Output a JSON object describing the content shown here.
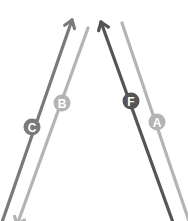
{
  "diagram": {
    "type": "lane-direction-diagram",
    "background": "#ffffff",
    "lanes": [
      {
        "id": "C",
        "label": "C",
        "color": "#7a7a7a",
        "direction": "up-right",
        "arrowhead": "top",
        "line": {
          "x1": 0,
          "y1": 228,
          "x2": 72,
          "y2": 20
        },
        "badge": {
          "cx": 32,
          "cy": 127
        }
      },
      {
        "id": "B",
        "label": "B",
        "color": "#b4b4b4",
        "direction": "up-right",
        "arrowhead": "bottom",
        "line": {
          "x1": 17,
          "y1": 225,
          "x2": 88,
          "y2": 28
        },
        "badge": {
          "cx": 62,
          "cy": 103
        }
      },
      {
        "id": "F",
        "label": "F",
        "color": "#555555",
        "direction": "up-left",
        "arrowhead": "top",
        "line": {
          "x1": 175,
          "y1": 228,
          "x2": 101,
          "y2": 22
        },
        "badge": {
          "cx": 131,
          "cy": 101
        }
      },
      {
        "id": "A",
        "label": "A",
        "color": "#b4b4b4",
        "direction": "up-left",
        "arrowhead": "bottom",
        "line": {
          "x1": 192,
          "y1": 230,
          "x2": 122,
          "y2": 23
        },
        "badge": {
          "cx": 157,
          "cy": 122
        }
      }
    ]
  }
}
